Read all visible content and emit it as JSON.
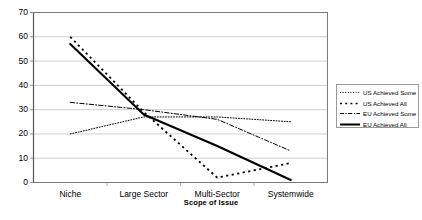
{
  "chart_data": {
    "type": "line",
    "title": "",
    "xlabel": "Scope of Issue",
    "ylabel": "",
    "categories": [
      "Niche",
      "Large Sector",
      "Multi-Sector",
      "Systemwide"
    ],
    "ylim": [
      0,
      70
    ],
    "ytick_step": 10,
    "yticks": [
      "0",
      "10",
      "20",
      "30",
      "40",
      "50",
      "60",
      "70"
    ],
    "grid": true,
    "grid_axis": "y",
    "legend_position": "right",
    "series": [
      {
        "name": "US Achieved Some",
        "values": [
          20,
          27,
          27,
          25
        ],
        "style": "dotted",
        "color": "#000000"
      },
      {
        "name": "US Achieved All",
        "values": [
          60,
          29,
          2,
          8
        ],
        "style": "square-dashed",
        "color": "#000000"
      },
      {
        "name": "EU Achieved Some",
        "values": [
          33,
          30,
          26,
          13
        ],
        "style": "dash-dot",
        "color": "#000000"
      },
      {
        "name": "EU Achieved All",
        "values": [
          57,
          28,
          15,
          1
        ],
        "style": "solid",
        "color": "#000000"
      }
    ]
  },
  "axis": {
    "x_title": "Scope of Issue"
  },
  "legend": {
    "entries": [
      {
        "label": "US Achieved Some"
      },
      {
        "label": "US Achieved All"
      },
      {
        "label": "EU Achieved Some"
      },
      {
        "label": "EU Achieved All"
      }
    ]
  }
}
